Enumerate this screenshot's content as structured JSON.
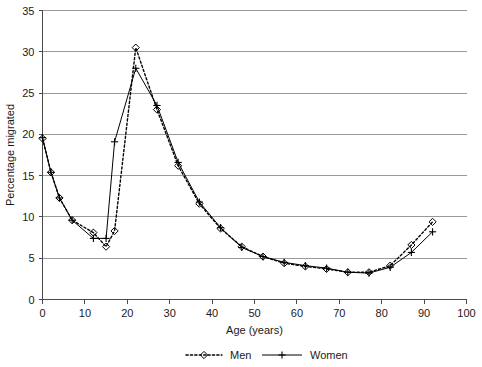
{
  "chart_data": {
    "type": "line",
    "title": "",
    "xlabel": "Age (years)",
    "ylabel": "Percentage migrated",
    "xlim": [
      0,
      100
    ],
    "ylim": [
      0,
      35
    ],
    "xticks": [
      0,
      10,
      20,
      30,
      40,
      50,
      60,
      70,
      80,
      90,
      100
    ],
    "yticks": [
      0,
      5,
      10,
      15,
      20,
      25,
      30,
      35
    ],
    "grid": "horizontal",
    "legend_position": "bottom",
    "series": [
      {
        "name": "Men",
        "marker": "diamond",
        "line_style": "dotted",
        "x": [
          0,
          2,
          4,
          7,
          12,
          15,
          17,
          22,
          27,
          32,
          37,
          42,
          47,
          52,
          57,
          62,
          67,
          72,
          77,
          82,
          87,
          92
        ],
        "values": [
          19.5,
          15.4,
          12.3,
          9.6,
          8.1,
          6.4,
          8.3,
          30.5,
          23.0,
          16.2,
          11.6,
          8.6,
          6.4,
          5.2,
          4.4,
          4.0,
          3.7,
          3.3,
          3.3,
          4.1,
          6.6,
          9.4
        ]
      },
      {
        "name": "Women",
        "marker": "plus",
        "line_style": "solid",
        "x": [
          0,
          2,
          4,
          7,
          12,
          15,
          17,
          22,
          27,
          32,
          37,
          42,
          47,
          52,
          57,
          62,
          67,
          72,
          77,
          82,
          87,
          92
        ],
        "values": [
          19.6,
          15.4,
          12.3,
          9.6,
          7.4,
          7.4,
          19.1,
          28.0,
          23.5,
          16.6,
          11.8,
          8.7,
          6.3,
          5.2,
          4.5,
          4.1,
          3.8,
          3.3,
          3.2,
          3.9,
          5.7,
          8.2
        ]
      }
    ],
    "colors": {
      "line": "#000000",
      "grid": "#9a9a9a",
      "axis": "#4a4a4a",
      "text": "#1a1a1a",
      "background": "#ffffff"
    }
  },
  "legend": {
    "items": [
      {
        "label": "Men"
      },
      {
        "label": "Women"
      }
    ]
  }
}
